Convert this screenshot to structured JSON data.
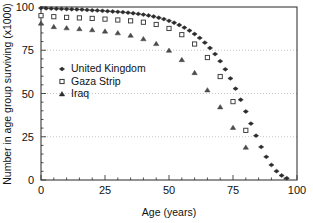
{
  "chart_data": {
    "type": "line",
    "title": "",
    "xlabel": "Age (years)",
    "ylabel": "Number in age group surviving (x1000)",
    "xlim": [
      0,
      100
    ],
    "ylim": [
      0,
      100
    ],
    "xticks": [
      0,
      25,
      50,
      75,
      100
    ],
    "yticks": [
      0,
      25,
      50,
      75,
      100
    ],
    "xtick_labels": [
      "0",
      "25",
      "50",
      "75",
      "100"
    ],
    "ytick_labels": [
      "0",
      "25",
      "50",
      "75",
      "100"
    ],
    "grid": "horizontal-dotted",
    "legend_position": "upper-left-inside",
    "series": [
      {
        "name": "United Kingdom",
        "marker": "filled-diamond",
        "color": "#2b2b2b",
        "x": [
          0,
          2,
          4,
          6,
          8,
          10,
          12,
          14,
          16,
          18,
          20,
          22,
          24,
          26,
          28,
          30,
          32,
          34,
          36,
          38,
          40,
          42,
          44,
          46,
          48,
          50,
          52,
          54,
          56,
          58,
          60,
          62,
          64,
          66,
          68,
          70,
          72,
          74,
          76,
          78,
          80,
          82,
          84,
          86,
          88,
          90,
          92,
          94,
          96
        ],
        "y": [
          99.4,
          99.2,
          99.1,
          99.0,
          98.9,
          98.8,
          98.7,
          98.6,
          98.5,
          98.3,
          98.1,
          98.0,
          97.8,
          97.6,
          97.4,
          97.2,
          97.0,
          96.7,
          96.4,
          96.0,
          95.6,
          95.1,
          94.5,
          93.8,
          93.0,
          92.0,
          90.9,
          89.6,
          88.1,
          86.4,
          84.4,
          82.1,
          79.4,
          76.3,
          72.8,
          68.7,
          64.0,
          58.7,
          52.8,
          46.4,
          39.6,
          32.6,
          25.6,
          19.1,
          13.4,
          8.7,
          5.1,
          2.6,
          1.0
        ]
      },
      {
        "name": "Gaza Strip",
        "marker": "open-square",
        "color": "#3a3a3a",
        "x": [
          0,
          5,
          10,
          15,
          20,
          25,
          30,
          35,
          40,
          45,
          50,
          55,
          60,
          65,
          70,
          75,
          80
        ],
        "y": [
          95.0,
          94.4,
          94.0,
          93.7,
          93.4,
          93.0,
          92.5,
          92.0,
          91.2,
          89.9,
          87.6,
          84.0,
          78.6,
          70.8,
          59.8,
          45.3,
          28.7
        ]
      },
      {
        "name": "Iraq",
        "marker": "filled-triangle",
        "color": "#4a4a4a",
        "x": [
          0,
          5,
          10,
          15,
          20,
          25,
          30,
          35,
          40,
          45,
          50,
          55,
          60,
          65,
          70,
          75,
          80
        ],
        "y": [
          90.6,
          88.6,
          87.9,
          87.4,
          86.8,
          86.0,
          85.0,
          83.6,
          81.6,
          78.8,
          74.9,
          69.5,
          62.0,
          52.0,
          42.2,
          30.3,
          18.9
        ]
      }
    ]
  },
  "legend": {
    "items": [
      {
        "label": "United Kingdom",
        "marker": "filled-diamond"
      },
      {
        "label": "Gaza Strip",
        "marker": "open-square"
      },
      {
        "label": "Iraq",
        "marker": "filled-triangle"
      }
    ]
  }
}
